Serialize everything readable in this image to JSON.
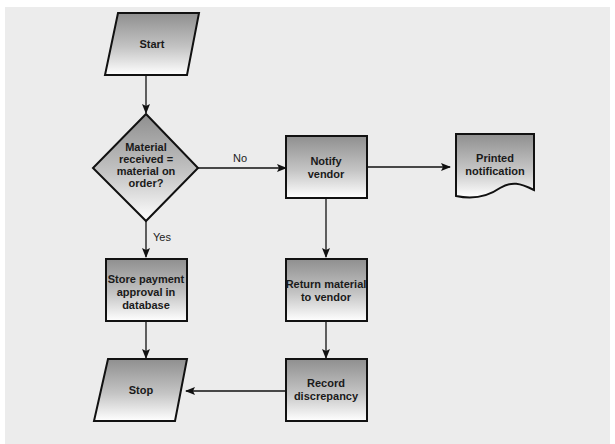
{
  "diagram": {
    "type": "flowchart",
    "background_color": "#ececec",
    "gradient": {
      "top": "#8f8f8f",
      "bottom": "#ffffff"
    },
    "nodes": [
      {
        "id": "start",
        "shape": "parallelogram",
        "label_lines": [
          "Start"
        ]
      },
      {
        "id": "decision",
        "shape": "diamond",
        "label_lines": [
          "Material",
          "received =",
          "material on",
          "order?"
        ]
      },
      {
        "id": "notify",
        "shape": "rectangle",
        "label_lines": [
          "Notify",
          "vendor"
        ]
      },
      {
        "id": "printed",
        "shape": "document",
        "label_lines": [
          "Printed",
          "notification"
        ]
      },
      {
        "id": "store",
        "shape": "rectangle",
        "label_lines": [
          "Store payment",
          "approval in",
          "database"
        ]
      },
      {
        "id": "return",
        "shape": "rectangle",
        "label_lines": [
          "Return material",
          "to vendor"
        ]
      },
      {
        "id": "record",
        "shape": "rectangle",
        "label_lines": [
          "Record",
          "discrepancy"
        ]
      },
      {
        "id": "stop",
        "shape": "parallelogram",
        "label_lines": [
          "Stop"
        ]
      }
    ],
    "edges": [
      {
        "from": "start",
        "to": "decision",
        "label": ""
      },
      {
        "from": "decision",
        "to": "notify",
        "label": "No"
      },
      {
        "from": "decision",
        "to": "store",
        "label": "Yes"
      },
      {
        "from": "notify",
        "to": "printed",
        "label": ""
      },
      {
        "from": "notify",
        "to": "return",
        "label": ""
      },
      {
        "from": "return",
        "to": "record",
        "label": ""
      },
      {
        "from": "store",
        "to": "stop",
        "label": ""
      },
      {
        "from": "record",
        "to": "stop",
        "label": ""
      }
    ]
  }
}
